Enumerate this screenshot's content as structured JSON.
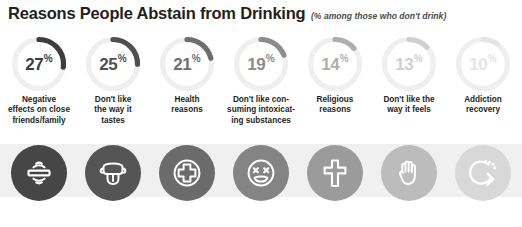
{
  "header": {
    "title": "Reasons People Abstain from Drinking",
    "subtitle": "(% among those who don't drink)"
  },
  "colors": {
    "title": "#231f20",
    "track": "#efefef",
    "band": "#f0f0f0",
    "arc_shades": [
      "#3d3d3d",
      "#4f4f4f",
      "#6e6e6e",
      "#8c8c8c",
      "#aeaeae",
      "#cfcfcf",
      "#e4e4e4"
    ],
    "icon_shades": [
      "#464646",
      "#555555",
      "#6b6b6b",
      "#848484",
      "#9b9b9b",
      "#bcbcbc",
      "#d8d8d8"
    ]
  },
  "chart_data": {
    "type": "pie",
    "title": "Reasons People Abstain from Drinking",
    "subtitle": "(% among those who don't drink)",
    "unit": "%",
    "categories": [
      "Negative effects on close friends/family",
      "Don't like the way it tastes",
      "Health reasons",
      "Don't like consuming intoxicating substances",
      "Religious reasons",
      "Don't like the way it feels",
      "Addiction recovery"
    ],
    "values": [
      27,
      25,
      21,
      19,
      14,
      13,
      10
    ],
    "legend": "none",
    "grid": false
  },
  "items": [
    {
      "value": 27,
      "value_text": "27",
      "symbol": "%",
      "label_lines": [
        "Negative",
        "effects on close",
        "friends/family"
      ],
      "icon": "broken-bond-icon"
    },
    {
      "value": 25,
      "value_text": "25",
      "symbol": "%",
      "label_lines": [
        "Don't like",
        "the way it",
        "tastes"
      ],
      "icon": "tongue-taste-icon"
    },
    {
      "value": 21,
      "value_text": "21",
      "symbol": "%",
      "label_lines": [
        "Health",
        "reasons"
      ],
      "icon": "medical-cross-icon"
    },
    {
      "value": 19,
      "value_text": "19",
      "symbol": "%",
      "label_lines": [
        "Don't like con-",
        "suming intoxicat-",
        "ing substances"
      ],
      "icon": "sick-face-icon"
    },
    {
      "value": 14,
      "value_text": "14",
      "symbol": "%",
      "label_lines": [
        "Religious",
        "reasons"
      ],
      "icon": "cross-icon"
    },
    {
      "value": 13,
      "value_text": "13",
      "symbol": "%",
      "label_lines": [
        "Don't like the",
        "way it feels"
      ],
      "icon": "stop-hand-icon"
    },
    {
      "value": 10,
      "value_text": "10",
      "symbol": "%",
      "label_lines": [
        "Addiction",
        "recovery"
      ],
      "icon": "recovery-arrow-icon"
    }
  ]
}
